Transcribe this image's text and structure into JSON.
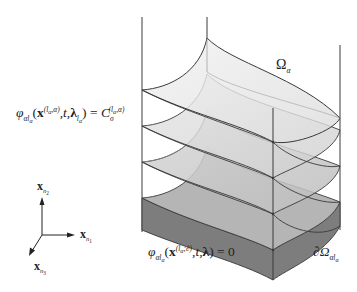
{
  "figure": {
    "type": "level-set-diagram",
    "colors": {
      "stroke": "#3a3a3a",
      "layer_top": "#ececec",
      "layer_2": "#dedede",
      "layer_3": "#cfcfcf",
      "layer_bottom_top": "#b9b9b9",
      "layer_bottom_side": "#7a7a7a",
      "background": "#ffffff"
    },
    "labels": {
      "region": {
        "symbol": "Ω",
        "subscript": "α"
      },
      "level_set_eq": {
        "phi": "φ",
        "phi_sub": "αl",
        "phi_sub_sub": "α",
        "open": "(",
        "x": "x",
        "x_sup": "(l",
        "x_sup_sub": "α",
        "x_sup_rest": ",α)",
        "args": ",t,",
        "lambda": "λ",
        "lambda_sub": "l",
        "lambda_sub_sub": "α",
        "close": ") =",
        "C": "C",
        "C_sub": "σ",
        "C_sup": "(l",
        "C_sup_sub": "α",
        "C_sup_rest": ",α)"
      },
      "zero_eq": {
        "phi": "φ",
        "phi_sub": "αl",
        "phi_sub_sub": "α",
        "open": "(",
        "x": "x",
        "x_sup": "(l",
        "x_sup_sub": "α",
        "x_sup_rest": ";∂)",
        "args": ",t,",
        "lambda": "λ",
        "close": ") = 0"
      },
      "boundary": {
        "symbol": "∂Ω",
        "subscript": "αl",
        "subscript_sub": "α"
      }
    },
    "axes": {
      "x_n2": {
        "base": "x",
        "sub": "n",
        "sub_sub": "2"
      },
      "x_n1": {
        "base": "x",
        "sub": "n",
        "sub_sub": "1"
      },
      "x_n3": {
        "base": "x",
        "sub": "n",
        "sub_sub": "3"
      }
    }
  }
}
